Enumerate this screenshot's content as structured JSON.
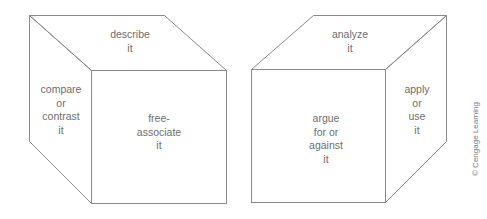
{
  "diagram": {
    "line_color": "#8a8a8a",
    "text_color": "#6d6d6d",
    "cubes": [
      {
        "name": "left-cube",
        "faces": {
          "top": [
            "describe",
            "it"
          ],
          "side": [
            "compare",
            "or",
            "contrast",
            "it"
          ],
          "front": [
            "free-",
            "associate",
            "it"
          ]
        }
      },
      {
        "name": "right-cube",
        "faces": {
          "top": [
            "analyze",
            "it"
          ],
          "side": [
            "apply",
            "or",
            "use",
            "it"
          ],
          "front": [
            "argue",
            "for or",
            "against",
            "it"
          ]
        }
      }
    ],
    "credit": "© Cengage Learning"
  }
}
